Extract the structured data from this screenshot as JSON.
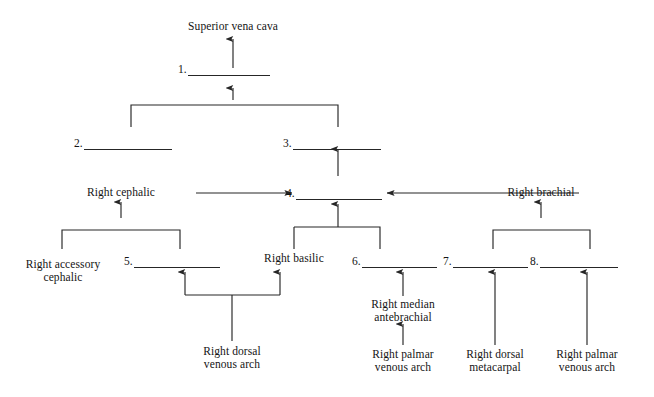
{
  "diagram": {
    "type": "venous-drainage-flowchart",
    "title_node": "Superior vena cava",
    "background_color": "#ffffff",
    "line_color": "#262626",
    "text_color": "#141414",
    "numbered_blanks": [
      {
        "number": "1.",
        "answer": ""
      },
      {
        "number": "2.",
        "answer": ""
      },
      {
        "number": "3.",
        "answer": ""
      },
      {
        "number": "4.",
        "answer": ""
      },
      {
        "number": "5.",
        "answer": ""
      },
      {
        "number": "6.",
        "answer": ""
      },
      {
        "number": "7.",
        "answer": ""
      },
      {
        "number": "8.",
        "answer": ""
      }
    ],
    "labels": {
      "superior_vena_cava": "Superior vena cava",
      "right_cephalic": "Right cephalic",
      "right_brachial": "Right brachial",
      "right_accessory_cephalic": "Right accessory\ncephalic",
      "right_basilic": "Right basilic",
      "right_dorsal_venous_arch": "Right dorsal\nvenous arch",
      "right_median_antebrachial": "Right median\nantebrachial",
      "right_palmar_venous_arch_left": "Right palmar\nvenous arch",
      "right_dorsal_metacarpal": "Right dorsal\nmetacarpal",
      "right_palmar_venous_arch_right": "Right palmar\nvenous arch"
    }
  }
}
